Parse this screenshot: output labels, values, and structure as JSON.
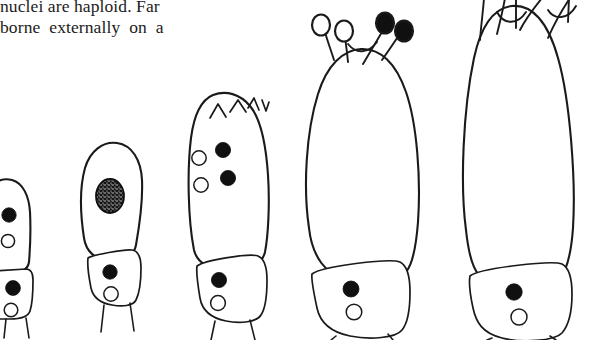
{
  "page": {
    "width": 590,
    "height": 340,
    "background_color": "#ffffff",
    "ink_color": "#1a1a1a"
  },
  "text_block": {
    "lines": [
      {
        "id": "line-1",
        "text": "nuclei are haploid. Far",
        "clipped": "top-cropped"
      },
      {
        "id": "line-2",
        "text": "borne  externally  on  a",
        "clipped": "none"
      }
    ]
  },
  "figure": {
    "caption": "",
    "stage_count": 5,
    "stages": [
      {
        "id": "stage-1",
        "label": "stage-1-young-basidium",
        "clipped": "left-edge",
        "body": {
          "shape": "narrow-club",
          "top": "rounded",
          "nuclei_filled": 1,
          "nuclei_open": 1,
          "nuclei_stippled": 0
        },
        "basal_cell": {
          "present": true,
          "nuclei_filled": 1,
          "nuclei_open": 1
        },
        "sterigmata": 0,
        "spores_open": 0,
        "spores_filled": 0
      },
      {
        "id": "stage-2",
        "label": "stage-2-nuclear-fusion",
        "clipped": "none",
        "body": {
          "shape": "club",
          "top": "rounded",
          "nuclei_filled": 0,
          "nuclei_open": 0,
          "nuclei_stippled": 1
        },
        "basal_cell": {
          "present": true,
          "nuclei_filled": 1,
          "nuclei_open": 1
        },
        "sterigmata": 0,
        "spores_open": 0,
        "spores_filled": 0
      },
      {
        "id": "stage-3",
        "label": "stage-3-meiosis-four-nuclei",
        "clipped": "none",
        "body": {
          "shape": "broad-club",
          "top": "crowned-with-emerging-sterigmata",
          "nuclei_filled": 2,
          "nuclei_open": 2,
          "nuclei_stippled": 0
        },
        "basal_cell": {
          "present": true,
          "nuclei_filled": 1,
          "nuclei_open": 1
        },
        "sterigmata": 0,
        "spores_open": 0,
        "spores_filled": 0
      },
      {
        "id": "stage-4",
        "label": "stage-4-four-spores-on-sterigmata",
        "clipped": "none",
        "body": {
          "shape": "large-club",
          "top": "four-sterigmata",
          "nuclei_filled": 0,
          "nuclei_open": 0,
          "nuclei_stippled": 0
        },
        "basal_cell": {
          "present": true,
          "nuclei_filled": 1,
          "nuclei_open": 1
        },
        "sterigmata": 4,
        "spores_open": 2,
        "spores_filled": 2
      },
      {
        "id": "stage-5",
        "label": "stage-5-mature-basidium",
        "clipped": "top-edge",
        "body": {
          "shape": "largest-club",
          "top": "sterigmata-cropped-above-frame",
          "nuclei_filled": 0,
          "nuclei_open": 0,
          "nuclei_stippled": 0
        },
        "basal_cell": {
          "present": true,
          "nuclei_filled": 1,
          "nuclei_open": 1
        },
        "sterigmata": 4,
        "spores_open": 0,
        "spores_filled": 0
      }
    ],
    "legend": {
      "filled_circle": "darkly-stained-nucleus",
      "open_circle": "unstained-nucleus",
      "stippled_oval": "fusing-nuclei"
    }
  }
}
